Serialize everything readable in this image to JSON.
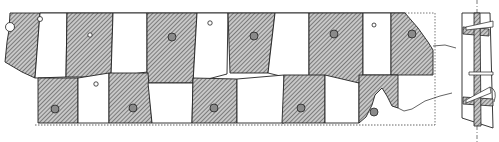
{
  "figure": {
    "type": "technical-drawing",
    "views": [
      "plan",
      "cross-section"
    ],
    "caption_visible_text": "",
    "colors": {
      "line": "#222222",
      "hatch": "#333333",
      "hatch_bg": "#bdbdbd",
      "peg_fill": "#8a8a8a",
      "dotted": "#555555",
      "background": "#ffffff"
    }
  },
  "plan": {
    "upper_row_blocks": [
      {
        "id": "U1",
        "hatched": true,
        "points": "10,13 40,13 35,78 22,72 5,62 7,42 9,30",
        "peg": [
          10,
          27,
          4.5,
          "hollow"
        ]
      },
      {
        "id": "U2",
        "hatched": false,
        "points": "40,13 67,13 66,77 35,78",
        "peg": [
          40,
          19,
          2.5,
          "hollow"
        ]
      },
      {
        "id": "U3",
        "hatched": true,
        "points": "67,13 113,13 111,77 66,77",
        "peg": [
          90,
          35,
          2.2,
          "hollow"
        ]
      },
      {
        "id": "U4",
        "hatched": false,
        "points": "113,13 147,13 147,72 111,77",
        "peg": null
      },
      {
        "id": "U5",
        "hatched": true,
        "points": "147,13 197,13 193,83 147,83",
        "peg": [
          172,
          37,
          4,
          "filled"
        ]
      },
      {
        "id": "U6",
        "hatched": false,
        "points": "197,13 228,13 227,74 193,83",
        "peg": [
          210,
          23,
          2.2,
          "hollow"
        ]
      },
      {
        "id": "U7",
        "hatched": true,
        "points": "228,13 275,13 268,73 230,73",
        "peg": [
          254,
          36,
          4,
          "filled"
        ]
      },
      {
        "id": "U8",
        "hatched": false,
        "points": "275,13 309,13 309,83 268,73",
        "peg": null
      },
      {
        "id": "U9",
        "hatched": true,
        "points": "309,13 363,13 363,83 309,83",
        "peg": [
          334,
          34,
          4,
          "filled"
        ]
      },
      {
        "id": "U10",
        "hatched": false,
        "points": "363,13 391,13 391,75 363,75",
        "peg": [
          374,
          25,
          2,
          "hollow"
        ]
      },
      {
        "id": "U11",
        "hatched": true,
        "points": "391,13 405,13 418,28 428,42 433,50 433,75 391,75",
        "peg": [
          412,
          34,
          4,
          "filled"
        ]
      }
    ],
    "lower_row_blocks": [
      {
        "id": "L1",
        "hatched": true,
        "points": "38,78 78,78 78,123 38,123",
        "peg": [
          55,
          109,
          4,
          "filled"
        ]
      },
      {
        "id": "L2",
        "hatched": false,
        "points": "78,78 109,73 109,123 78,123",
        "peg": [
          96,
          84,
          2.2,
          "hollow"
        ]
      },
      {
        "id": "L3",
        "hatched": true,
        "points": "109,73 148,73 152,123 109,123",
        "peg": [
          133,
          108,
          4,
          "filled"
        ]
      },
      {
        "id": "L4",
        "hatched": false,
        "points": "148,83 193,83 192,123 152,123",
        "peg": null
      },
      {
        "id": "L5",
        "hatched": true,
        "points": "193,78 237,79 237,123 192,123",
        "peg": [
          214,
          108,
          4,
          "filled"
        ]
      },
      {
        "id": "L6",
        "hatched": false,
        "points": "237,79 284,75 284,123 237,123",
        "peg": null
      },
      {
        "id": "L7",
        "hatched": true,
        "points": "284,75 325,75 325,123 282,123",
        "peg": [
          301,
          108,
          4,
          "filled"
        ]
      },
      {
        "id": "L8",
        "hatched": false,
        "points": "325,75 359,83 359,123 325,123",
        "peg": null
      },
      {
        "id": "L9",
        "hatched": true,
        "points": "359,75 398,75 398,108 392,106 387,96 382,88 375,95 372,105 366,117 359,123",
        "peg": [
          374,
          112,
          4,
          "filled"
        ]
      }
    ],
    "outline": {
      "dotted_bottom_y": 125,
      "dotted_extent": [
        35,
        435
      ],
      "dotted_right_box": "405,13 435,13 435,125"
    },
    "break_lines": [
      "433,46 445,45 456,48",
      "398,108 404,111 412,109 425,101 440,96 452,93"
    ]
  },
  "section": {
    "axis_x": 477,
    "outline": "462,13 490,13 493,128 462,118",
    "core": "474,13 480,13 481,126 474,126",
    "hatched_bands": [
      "463,27 489,29 489,36 463,34",
      "463,97 493,99 493,106 463,104"
    ],
    "pegs": [
      "466,27 493,21 493,27 466,30",
      "469,72 493,72 493,75 469,75",
      "466,100 490,87 491,93 466,103"
    ]
  }
}
